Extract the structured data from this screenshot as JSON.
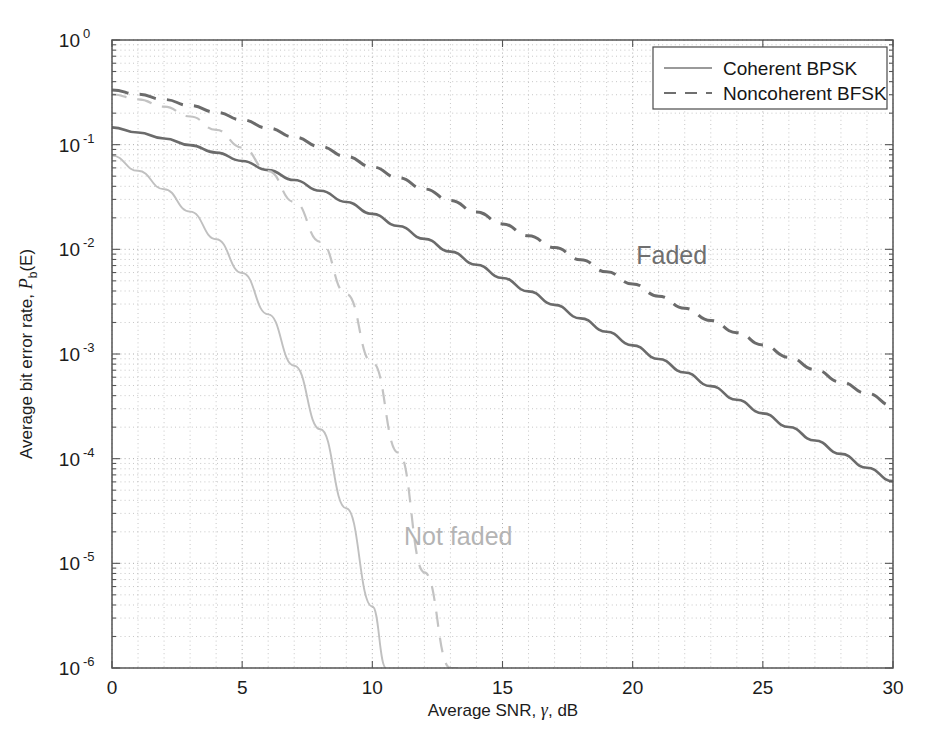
{
  "chart_data": {
    "type": "line",
    "title": "",
    "xlabel": "Average SNR, γ, dB",
    "ylabel": "Average bit error rate, P_b(E)",
    "ylabel_main": "Average bit error rate, ",
    "ylabel_italic": "P",
    "ylabel_sub": "b",
    "ylabel_tail": "(E)",
    "xlabel_pre": "Average SNR, ",
    "xlabel_gamma": "γ",
    "xlabel_post": ", dB",
    "xscale": "linear",
    "yscale": "log",
    "xlim": [
      0,
      30
    ],
    "ylim": [
      1e-06,
      1
    ],
    "xticks": [
      0,
      5,
      10,
      15,
      20,
      25,
      30
    ],
    "xtick_labels": [
      "0",
      "5",
      "10",
      "15",
      "20",
      "25",
      "30"
    ],
    "yticks": [
      1,
      0.1,
      0.01,
      0.001,
      0.0001,
      1e-05,
      1e-06
    ],
    "ytick_labels": [
      "10",
      "10",
      "10",
      "10",
      "10",
      "10",
      "10"
    ],
    "ytick_exponents": [
      "0",
      "-1",
      "-2",
      "-3",
      "-4",
      "-5",
      "-6"
    ],
    "grid": true,
    "grid_minor": true,
    "legend_position": "upper right",
    "legend_entries": [
      {
        "label": "Coherent BPSK",
        "style": "solid"
      },
      {
        "label": "Noncoherent BFSK",
        "style": "dashed"
      }
    ],
    "annotations": [
      {
        "text": "Faded",
        "x": 21.5,
        "y": 0.0072,
        "color": "#6f6f6f"
      },
      {
        "text": "Not faded",
        "x": 13.3,
        "y": 1.5e-05,
        "color": "#b4b4b4"
      }
    ],
    "series": [
      {
        "name": "Faded Coherent BPSK",
        "style": "solid",
        "shade": "dark",
        "color": "#6b6b6b",
        "x": [
          0,
          1,
          2,
          3,
          4,
          5,
          6,
          7,
          8,
          9,
          10,
          11,
          12,
          13,
          14,
          15,
          16,
          17,
          18,
          19,
          20,
          21,
          22,
          23,
          24,
          25,
          26,
          27,
          28,
          29,
          30
        ],
        "y": [
          0.1464,
          0.1306,
          0.1147,
          0.0991,
          0.084,
          0.0699,
          0.0571,
          0.0459,
          0.0363,
          0.0283,
          0.0218,
          0.0167,
          0.0126,
          0.00951,
          0.00713,
          0.00533,
          0.00397,
          0.00295,
          0.00219,
          0.00163,
          0.00121,
          0.000896,
          0.000665,
          0.000493,
          0.000366,
          0.000271,
          0.000201,
          0.000149,
          0.000111,
          8.2e-05,
          6.1e-05
        ]
      },
      {
        "name": "Faded Noncoherent BFSK",
        "style": "dashed",
        "shade": "dark",
        "color": "#6b6b6b",
        "x": [
          0,
          1,
          2,
          3,
          4,
          5,
          6,
          7,
          8,
          9,
          10,
          11,
          12,
          13,
          14,
          15,
          16,
          17,
          18,
          19,
          20,
          21,
          22,
          23,
          24,
          25,
          26,
          27,
          28,
          29,
          30
        ],
        "y": [
          0.3333,
          0.3026,
          0.27,
          0.2367,
          0.2039,
          0.1727,
          0.144,
          0.1183,
          0.096,
          0.077,
          0.0612,
          0.0482,
          0.0377,
          0.0293,
          0.0227,
          0.0175,
          0.0135,
          0.0104,
          0.00795,
          0.0061,
          0.00467,
          0.00357,
          0.00273,
          0.00209,
          0.0016,
          0.00122,
          0.00093,
          0.00071,
          0.00054,
          0.00042,
          0.00032
        ]
      },
      {
        "name": "Not faded Coherent BPSK",
        "style": "solid",
        "shade": "light",
        "color": "#c0c0c0",
        "x": [
          0,
          1,
          2,
          3,
          4,
          5,
          6,
          7,
          8,
          9,
          10,
          10.53
        ],
        "y": [
          0.0786,
          0.0563,
          0.0375,
          0.0229,
          0.0125,
          0.00595,
          0.00239,
          0.000773,
          0.000191,
          3.36e-05,
          3.87e-06,
          1e-06
        ]
      },
      {
        "name": "Not faded Noncoherent BFSK",
        "style": "dashed",
        "shade": "light",
        "color": "#c3c3c3",
        "x": [
          0,
          1,
          2,
          3,
          4,
          5,
          6,
          7,
          8,
          9,
          10,
          11,
          12,
          13,
          14
        ],
        "y": [
          0.3033,
          0.2704,
          0.2308,
          0.1859,
          0.1387,
          0.0937,
          0.0558,
          0.0284,
          0.0118,
          0.00375,
          0.000827,
          0.000114,
          8.2e-06,
          2.6e-07,
          1e-06
        ]
      }
    ]
  },
  "figure": {
    "background": "#ffffff",
    "axis_color": "#555555",
    "grid_color": "#b9b9b9"
  }
}
